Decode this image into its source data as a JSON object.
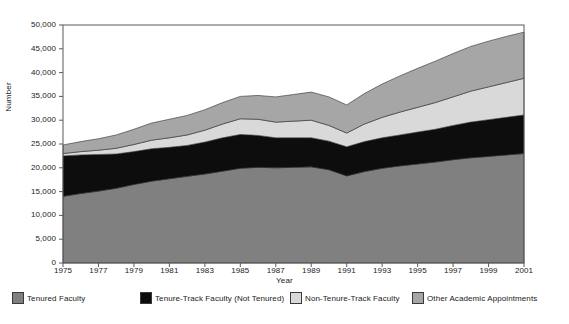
{
  "chart_data": {
    "type": "area",
    "stacked": true,
    "title": "",
    "xlabel": "Year",
    "ylabel": "Number",
    "x": [
      1975,
      1976,
      1977,
      1978,
      1979,
      1980,
      1981,
      1982,
      1983,
      1984,
      1985,
      1986,
      1987,
      1988,
      1989,
      1990,
      1991,
      1992,
      1993,
      1994,
      1995,
      1996,
      1997,
      1998,
      1999,
      2000,
      2001
    ],
    "xlim": [
      1975,
      2001
    ],
    "ylim": [
      0,
      50000
    ],
    "yticks": [
      0,
      5000,
      10000,
      15000,
      20000,
      25000,
      30000,
      35000,
      40000,
      45000,
      50000
    ],
    "ytick_labels": [
      "0",
      "5,000",
      "10,000",
      "15,000",
      "20,000",
      "25,000",
      "30,000",
      "35,000",
      "40,000",
      "45,000",
      "50,000"
    ],
    "xtick_labels": [
      "1975",
      "1977",
      "1979",
      "1981",
      "1983",
      "1985",
      "1987",
      "1989",
      "1991",
      "1993",
      "1995",
      "1997",
      "1999",
      "2001"
    ],
    "grid": false,
    "legend_position": "bottom",
    "series": [
      {
        "name": "Tenured Faculty",
        "color": "#808080",
        "values": [
          14000,
          14600,
          15100,
          15700,
          16500,
          17200,
          17700,
          18200,
          18700,
          19300,
          19900,
          20100,
          20000,
          20100,
          20200,
          19600,
          18300,
          19200,
          19900,
          20400,
          20800,
          21200,
          21700,
          22100,
          22400,
          22700,
          23000
        ]
      },
      {
        "name": "Tenure-Track Faculty (Not Tenured)",
        "color": "#0d0d0d",
        "values": [
          8500,
          8100,
          7700,
          7200,
          6900,
          6800,
          6600,
          6500,
          6700,
          7000,
          7100,
          6700,
          6300,
          6200,
          6100,
          6000,
          6100,
          6300,
          6400,
          6500,
          6700,
          6900,
          7200,
          7500,
          7700,
          7900,
          8100
        ]
      },
      {
        "name": "Non-Tenure-Track Faculty",
        "color": "#d9d9d9",
        "values": [
          500,
          700,
          900,
          1200,
          1500,
          1800,
          2000,
          2200,
          2500,
          2900,
          3300,
          3400,
          3300,
          3500,
          3700,
          3300,
          2900,
          3700,
          4300,
          4800,
          5200,
          5600,
          6000,
          6500,
          6900,
          7300,
          7700
        ]
      },
      {
        "name": "Other Academic Appointments",
        "color": "#a6a6a6",
        "values": [
          1800,
          2100,
          2400,
          2800,
          3200,
          3600,
          3900,
          4100,
          4300,
          4500,
          4700,
          5000,
          5300,
          5600,
          5900,
          6000,
          5900,
          6400,
          7000,
          7600,
          8200,
          8700,
          9100,
          9400,
          9600,
          9700,
          9700
        ]
      }
    ],
    "totals": [
      24800,
      25500,
      26100,
      26900,
      28100,
      29400,
      30200,
      31000,
      32200,
      33700,
      35000,
      35200,
      34900,
      35400,
      35900,
      34900,
      33200,
      35600,
      37600,
      39300,
      40900,
      42400,
      44000,
      45500,
      46600,
      47600,
      48500
    ]
  },
  "axis": {
    "ylabel": "Number",
    "xlabel": "Year"
  }
}
